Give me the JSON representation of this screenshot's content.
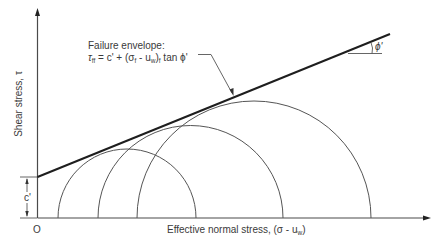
{
  "diagram": {
    "origin_label": "O",
    "x_axis_label": "Effective normal stress, (σ - u",
    "x_axis_label_sub": "w",
    "x_axis_label_close": ")",
    "y_axis_label": "Shear stress, τ",
    "envelope_label_line1": "Failure envelope:",
    "envelope_eq_tau": "τ",
    "envelope_eq_tau_sub": "ff",
    "envelope_eq_mid": " = c' + (σ",
    "envelope_eq_sigma_sub": "f",
    "envelope_eq_mid2": " - u",
    "envelope_eq_u_sub": "w",
    "envelope_eq_end": ")",
    "envelope_eq_end_sub": "f",
    "envelope_eq_tail": " tan ϕ'",
    "cohesion_label": "c'",
    "friction_angle_label": "ϕ'",
    "circles": [
      {
        "name": "mohr-circle-1",
        "left": 58,
        "right": 196
      },
      {
        "name": "mohr-circle-2",
        "left": 98,
        "right": 283
      },
      {
        "name": "mohr-circle-3",
        "left": 137,
        "right": 371
      }
    ],
    "colors": {
      "envelope": "#1e1e1e",
      "circles": "#555555",
      "axes": "#4a4a4a",
      "text": "#3a3a3a"
    }
  }
}
